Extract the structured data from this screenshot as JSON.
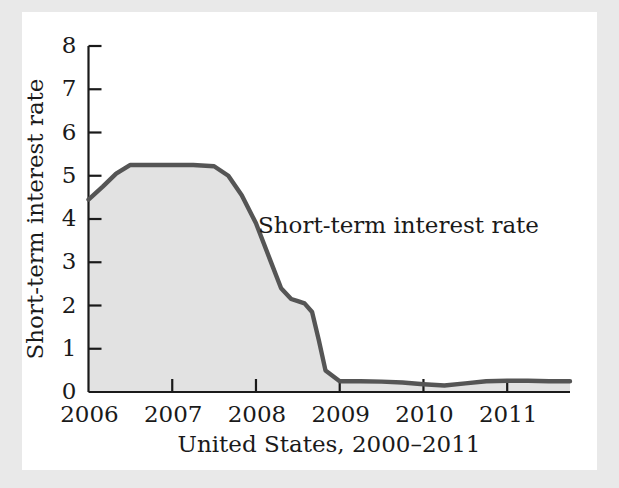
{
  "figure": {
    "background_color": "#e9e9e9",
    "card_color": "#ffffff"
  },
  "chart_data": {
    "type": "area",
    "title": "",
    "subtitle": "",
    "xlabel": "United States, 2000–2011",
    "ylabel": "Short-term interest rate",
    "annotation": "Short-term interest rate",
    "legend_position": "none",
    "grid": false,
    "line_color": "#555555",
    "fill_color": "#e2e2e2",
    "axis_color": "#1a1a1a",
    "xlim": [
      2006.0,
      2011.75
    ],
    "ylim": [
      0,
      8
    ],
    "xticks": [
      2006,
      2007,
      2008,
      2009,
      2010,
      2011
    ],
    "xtick_labels": [
      "2006",
      "2007",
      "2008",
      "2009",
      "2010",
      "2011"
    ],
    "yticks": [
      0,
      1,
      2,
      3,
      4,
      5,
      6,
      7,
      8
    ],
    "ytick_labels": [
      "0",
      "1",
      "2",
      "3",
      "4",
      "5",
      "6",
      "7",
      "8"
    ],
    "series": [
      {
        "name": "Short-term interest rate",
        "x": [
          2006.0,
          2006.17,
          2006.33,
          2006.5,
          2006.75,
          2007.0,
          2007.25,
          2007.5,
          2007.67,
          2007.83,
          2008.0,
          2008.17,
          2008.3,
          2008.42,
          2008.5,
          2008.58,
          2008.67,
          2008.75,
          2008.83,
          2009.0,
          2009.25,
          2009.5,
          2009.75,
          2010.0,
          2010.25,
          2010.5,
          2010.75,
          2011.0,
          2011.25,
          2011.5,
          2011.75
        ],
        "values": [
          4.45,
          4.75,
          5.05,
          5.25,
          5.25,
          5.25,
          5.25,
          5.22,
          5.0,
          4.55,
          3.9,
          3.05,
          2.4,
          2.15,
          2.1,
          2.05,
          1.85,
          1.2,
          0.5,
          0.25,
          0.25,
          0.24,
          0.22,
          0.18,
          0.15,
          0.2,
          0.25,
          0.26,
          0.26,
          0.25,
          0.25
        ]
      }
    ]
  }
}
